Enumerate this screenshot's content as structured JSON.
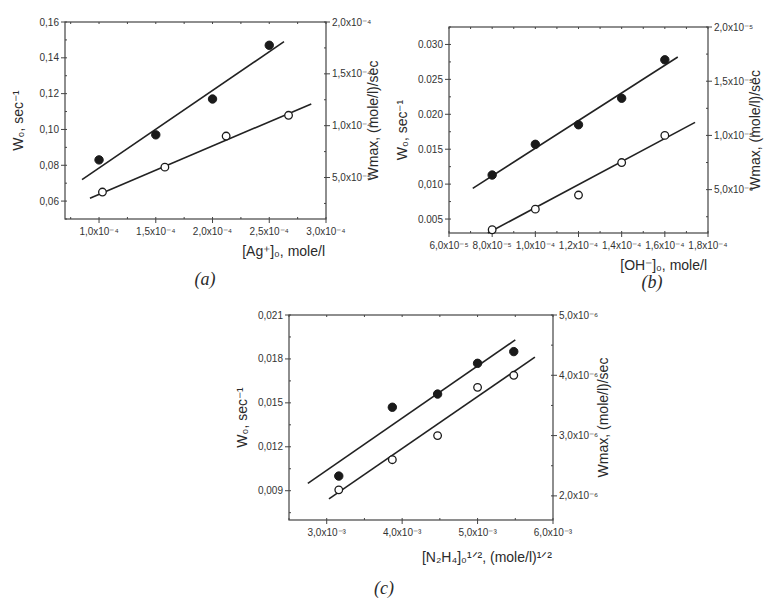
{
  "chart_data": [
    {
      "id": "a",
      "type": "scatter",
      "panel_label": "(a)",
      "xlabel": "[Ag⁺]₀, mole/l",
      "ylabel_left": "W₀, sec⁻¹",
      "ylabel_right": "Wmax, (mole/l)/sec",
      "xlim": [
        7e-05,
        0.0003
      ],
      "ylim_left": [
        0.05,
        0.16
      ],
      "ylim_right": [
        1e-05,
        0.0002
      ],
      "x_ticks": [
        0.0001,
        0.00015,
        0.0002,
        0.00025,
        0.0003
      ],
      "x_tick_labels": [
        "1,0x10⁻⁴",
        "1,5x10⁻⁴",
        "2,0x10⁻⁴",
        "2,5x10⁻⁴",
        "3,0x10⁻⁴"
      ],
      "y_left_ticks": [
        0.06,
        0.08,
        0.1,
        0.12,
        0.14,
        0.16
      ],
      "y_left_tick_labels": [
        "0,06",
        "0,08",
        "0,10",
        "0,12",
        "0,14",
        "0,16"
      ],
      "y_right_ticks": [
        5e-05,
        0.0001,
        0.00015,
        0.0002
      ],
      "y_right_tick_labels": [
        "5,0x10⁻⁵",
        "1,0x10⁻⁴",
        "1,5x10⁻⁴",
        "2,0x10⁻⁴"
      ],
      "series": [
        {
          "name": "W0 (filled)",
          "marker": "filled",
          "axis": "left",
          "x": [
            0.0001,
            0.00015,
            0.0002,
            0.00025
          ],
          "y": [
            0.083,
            0.097,
            0.117,
            0.147
          ],
          "fit": {
            "x": [
              8.5e-05,
              0.000263
            ],
            "y": [
              0.072,
              0.149
            ]
          }
        },
        {
          "name": "Wmax (open)",
          "marker": "open",
          "axis": "right",
          "x": [
            0.000103,
            0.000158,
            0.000212,
            0.000267
          ],
          "y": [
            3.6e-05,
            6e-05,
            9e-05,
            0.00011
          ],
          "fit": {
            "x": [
              9.2e-05,
              0.000287
            ],
            "y": [
              3e-05,
              0.000121
            ]
          }
        }
      ]
    },
    {
      "id": "b",
      "type": "scatter",
      "panel_label": "(b)",
      "xlabel": "[OH⁻]₀, mole/l",
      "ylabel_left": "W₀, sec⁻¹",
      "ylabel_right": "Wmax, (mole/l)/sec",
      "xlim": [
        6e-05,
        0.00018
      ],
      "ylim_left": [
        0.003,
        0.0325
      ],
      "ylim_right": [
        1e-06,
        2e-05
      ],
      "x_ticks": [
        6e-05,
        8e-05,
        0.0001,
        0.00012,
        0.00014,
        0.00016,
        0.00018
      ],
      "x_tick_labels": [
        "6,0x10⁻⁵",
        "8,0x10⁻⁵",
        "1,0x10⁻⁴",
        "1,2x10⁻⁴",
        "1,4x10⁻⁴",
        "1,6x10⁻⁴",
        "1,8x10⁻⁴"
      ],
      "y_left_ticks": [
        0.005,
        0.01,
        0.015,
        0.02,
        0.025,
        0.03
      ],
      "y_left_tick_labels": [
        "0.005",
        "0,010",
        "0.015",
        "0.020",
        "0.025",
        "0.030"
      ],
      "y_right_ticks": [
        5e-06,
        1e-05,
        1.5e-05,
        2e-05
      ],
      "y_right_tick_labels": [
        "5,0x10⁻⁶",
        "1,0x10⁻⁵",
        "1,5x10⁻⁵",
        "2,0x10⁻⁵"
      ],
      "series": [
        {
          "name": "W0 (filled)",
          "marker": "filled",
          "axis": "left",
          "x": [
            8e-05,
            0.0001,
            0.00012,
            0.00014,
            0.00016
          ],
          "y": [
            0.0113,
            0.0157,
            0.0185,
            0.0223,
            0.0278
          ],
          "fit": {
            "x": [
              7.1e-05,
              0.000166
            ],
            "y": [
              0.0094,
              0.0282
            ]
          }
        },
        {
          "name": "Wmax (open)",
          "marker": "open",
          "axis": "right",
          "x": [
            8e-05,
            0.0001,
            0.00012,
            0.00014,
            0.00016
          ],
          "y": [
            1.3e-06,
            3.2e-06,
            4.5e-06,
            7.5e-06,
            1e-05
          ],
          "fit": {
            "x": [
              7.8e-05,
              0.000174
            ],
            "y": [
              1e-06,
              1.12e-05
            ]
          }
        }
      ]
    },
    {
      "id": "c",
      "type": "scatter",
      "panel_label": "(c)",
      "xlabel": "[N₂H₄]₀¹ᐟ², (mole/l)¹ᐟ²",
      "ylabel_left": "W₀, sec⁻¹",
      "ylabel_right": "Wmax, (mole/l)/sec",
      "xlim": [
        0.0025,
        0.006
      ],
      "ylim_left": [
        0.007,
        0.021
      ],
      "ylim_right": [
        1.6e-06,
        5e-06
      ],
      "x_ticks": [
        0.003,
        0.004,
        0.005,
        0.006
      ],
      "x_tick_labels": [
        "3,0x10⁻³",
        "4,0x10⁻³",
        "5,0x10⁻³",
        "6,0x10⁻³"
      ],
      "y_left_ticks": [
        0.009,
        0.012,
        0.015,
        0.018,
        0.021
      ],
      "y_left_tick_labels": [
        "0,009",
        "0,012",
        "0,015",
        "0,018",
        "0,021"
      ],
      "y_right_ticks": [
        2e-06,
        3e-06,
        4e-06,
        5e-06
      ],
      "y_right_tick_labels": [
        "2,0x10⁻⁶",
        "3,0x10⁻⁶",
        "4,0x10⁻⁶",
        "5,0x10⁻⁶"
      ],
      "series": [
        {
          "name": "W0 (filled)",
          "marker": "filled",
          "axis": "left",
          "x": [
            0.00316,
            0.00387,
            0.00447,
            0.005,
            0.00548
          ],
          "y": [
            0.01,
            0.0147,
            0.0156,
            0.0177,
            0.0185
          ],
          "fit": {
            "x": [
              0.00275,
              0.0055
            ],
            "y": [
              0.0095,
              0.0193
            ]
          }
        },
        {
          "name": "Wmax (open)",
          "marker": "open",
          "axis": "right",
          "x": [
            0.00316,
            0.00387,
            0.00447,
            0.005,
            0.00548
          ],
          "y": [
            2.1e-06,
            2.6e-06,
            3e-06,
            3.8e-06,
            4e-06
          ],
          "fit": {
            "x": [
              0.00303,
              0.00576
            ],
            "y": [
              1.95e-06,
              4.3e-06
            ]
          }
        }
      ]
    }
  ]
}
